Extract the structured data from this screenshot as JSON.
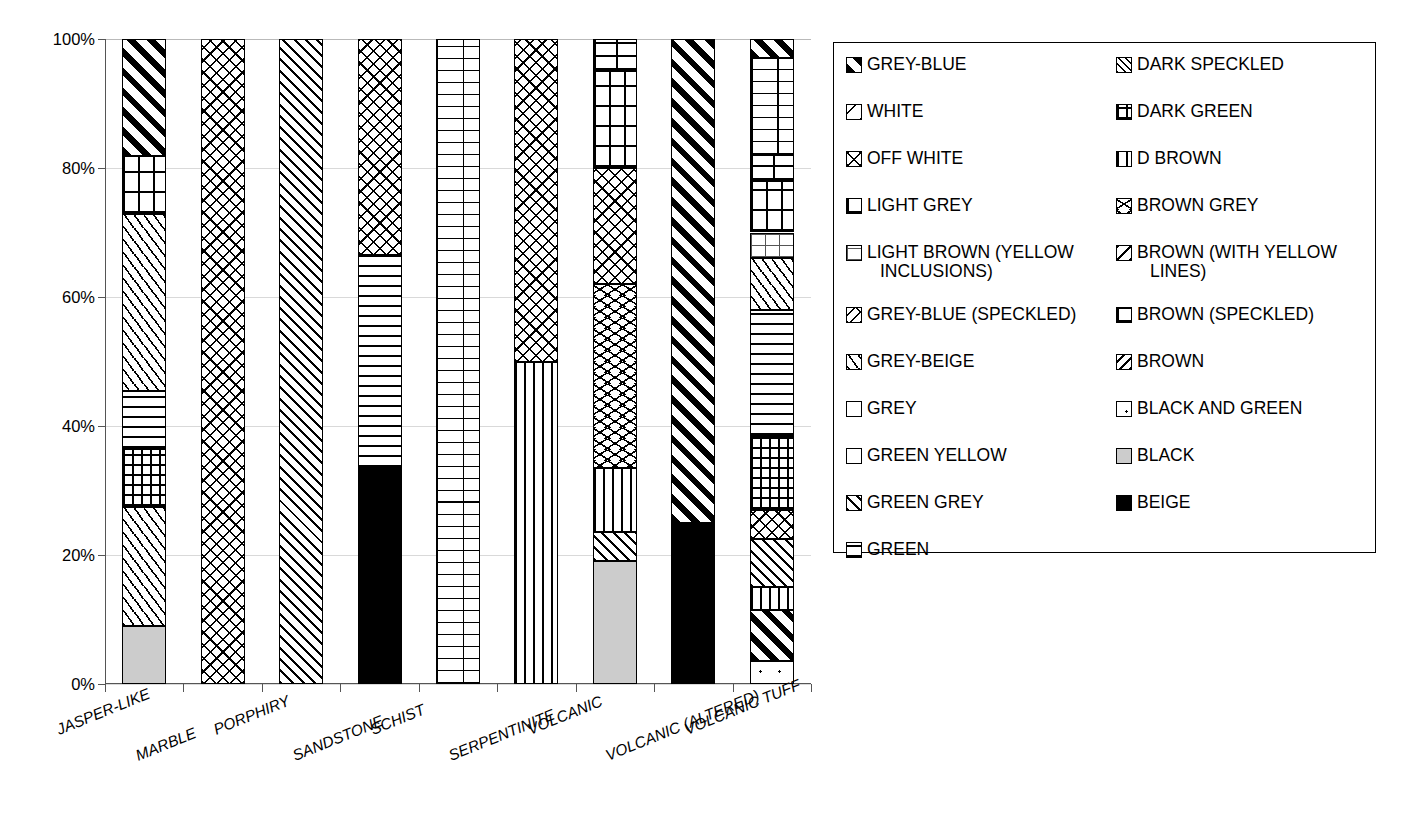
{
  "chart_data": {
    "type": "bar",
    "subtype": "stacked-100-percent",
    "title": "",
    "xlabel": "",
    "ylabel": "",
    "ylim": [
      0,
      100
    ],
    "ytick_labels": [
      "0%",
      "20%",
      "40%",
      "60%",
      "80%",
      "100%"
    ],
    "ytick_values": [
      0,
      20,
      40,
      60,
      80,
      100
    ],
    "grid": true,
    "legend_position": "right",
    "categories": [
      "JASPER-LIKE",
      "MARBLE",
      "PORPHIRY",
      "SANDSTONE",
      "SCHIST",
      "SERPENTINITE",
      "VOLCANIC",
      "VOLCANIC (ALTERED)",
      "VOLCANIC TUFF"
    ],
    "series": [
      {
        "name": "GREY-BLUE",
        "pattern": "p-greyblue",
        "values": [
          18.2,
          0,
          0,
          0,
          0,
          0,
          0,
          75.0,
          3.0
        ]
      },
      {
        "name": "WHITE",
        "pattern": "p-white",
        "values": [
          0,
          0,
          0,
          0,
          0,
          0,
          0,
          0,
          0
        ]
      },
      {
        "name": "OFF WHITE",
        "pattern": "p-offwhite",
        "values": [
          0,
          100,
          0,
          33.5,
          0,
          50.0,
          18.0,
          0,
          4.5
        ]
      },
      {
        "name": "LIGHT GREY",
        "pattern": "p-lightgrey",
        "values": [
          0,
          0,
          0,
          0,
          0,
          0,
          15.0,
          0,
          8.0
        ]
      },
      {
        "name": "LIGHT BROWN (YELLOW INCLUSIONS)",
        "pattern": "p-lightbrown",
        "values": [
          0,
          0,
          0,
          0,
          0,
          0,
          0,
          0,
          4.0
        ]
      },
      {
        "name": "GREY-BLUE (SPECKLED)",
        "pattern": "p-greyblue-sp",
        "values": [
          0,
          0,
          0,
          0,
          0,
          0,
          0,
          0,
          0
        ]
      },
      {
        "name": "GREY-BEIGE",
        "pattern": "p-greybeige",
        "values": [
          27.5,
          0,
          0,
          0,
          0,
          0,
          0,
          0,
          8.0
        ]
      },
      {
        "name": "GREY",
        "pattern": "p-grey",
        "values": [
          0,
          0,
          0,
          0,
          0,
          0,
          0,
          0,
          0
        ]
      },
      {
        "name": "GREEN YELLOW",
        "pattern": "p-greenyellow",
        "values": [
          0,
          0,
          0,
          0,
          0,
          0,
          0,
          0,
          0
        ]
      },
      {
        "name": "GREEN GREY",
        "pattern": "p-greengrey",
        "values": [
          0,
          0,
          100,
          0,
          0,
          0,
          4.5,
          0,
          7.5
        ]
      },
      {
        "name": "GREEN",
        "pattern": "p-green",
        "values": [
          9.0,
          0,
          0,
          33.0,
          0,
          0,
          0,
          0,
          19.5
        ]
      },
      {
        "name": "DARK SPECKLED",
        "pattern": "p-darkspeckled",
        "values": [
          0,
          0,
          0,
          0,
          0,
          0,
          0,
          0,
          0
        ]
      },
      {
        "name": "DARK GREEN",
        "pattern": "p-darkgreen",
        "values": [
          9.0,
          0,
          0,
          0,
          0,
          0,
          0,
          0,
          11.5
        ]
      },
      {
        "name": "D BROWN",
        "pattern": "p-dbrown",
        "values": [
          0,
          0,
          0,
          0,
          0,
          50.0,
          10.0,
          0,
          3.5
        ]
      },
      {
        "name": "BROWN GREY",
        "pattern": "p-browngrey",
        "values": [
          0,
          0,
          0,
          0,
          0,
          0,
          28.5,
          0,
          0
        ]
      },
      {
        "name": "BROWN (WITH YELLOW LINES)",
        "pattern": "p-brownyellow",
        "values": [
          0,
          0,
          0,
          0,
          0,
          0,
          0,
          0,
          0
        ]
      },
      {
        "name": "BROWN (SPECKLED)",
        "pattern": "p-brownspeckled",
        "values": [
          0,
          0,
          0,
          0,
          100,
          0,
          5.0,
          0,
          19.0
        ]
      },
      {
        "name": "BROWN",
        "pattern": "p-brown",
        "values": [
          0,
          0,
          0,
          0,
          0,
          0,
          0,
          0,
          0
        ]
      },
      {
        "name": "BLACK AND GREEN",
        "pattern": "p-blackgreen",
        "values": [
          0,
          0,
          0,
          0,
          0,
          0,
          0,
          0,
          3.5
        ]
      },
      {
        "name": "BLACK",
        "pattern": "p-black",
        "values": [
          9.0,
          0,
          0,
          0,
          0,
          0,
          19.0,
          0,
          0
        ]
      },
      {
        "name": "BEIGE",
        "pattern": "p-beige",
        "values": [
          0,
          0,
          0,
          33.5,
          0,
          0,
          0,
          25.0,
          0
        ]
      }
    ],
    "stacks": [
      {
        "category": "JASPER-LIKE",
        "segments": [
          {
            "name": "BLACK",
            "pattern": "p-black",
            "start": 0,
            "end": 9.0
          },
          {
            "name": "GREY-BEIGE",
            "pattern": "p-greybeige",
            "start": 9.0,
            "end": 27.5
          },
          {
            "name": "DARK GREEN",
            "pattern": "p-darkgreen",
            "start": 27.5,
            "end": 36.5
          },
          {
            "name": "GREEN",
            "pattern": "p-green",
            "start": 36.5,
            "end": 45.5
          },
          {
            "name": "GREY-BEIGE 2",
            "pattern": "p-greybeige",
            "start": 45.5,
            "end": 72.8
          },
          {
            "name": "LIGHT GREY",
            "pattern": "p-lightgrey",
            "start": 72.8,
            "end": 81.8
          },
          {
            "name": "GREY-BLUE",
            "pattern": "p-greyblue",
            "start": 81.8,
            "end": 100
          }
        ]
      },
      {
        "category": "MARBLE",
        "segments": [
          {
            "name": "OFF WHITE",
            "pattern": "p-offwhite",
            "start": 0,
            "end": 100
          }
        ]
      },
      {
        "category": "PORPHIRY",
        "segments": [
          {
            "name": "GREEN GREY",
            "pattern": "p-greengrey",
            "start": 0,
            "end": 100
          }
        ]
      },
      {
        "category": "SANDSTONE",
        "segments": [
          {
            "name": "BEIGE",
            "pattern": "p-beige",
            "start": 0,
            "end": 33.5
          },
          {
            "name": "GREEN",
            "pattern": "p-green",
            "start": 33.5,
            "end": 66.5
          },
          {
            "name": "OFF WHITE",
            "pattern": "p-offwhite",
            "start": 66.5,
            "end": 100
          }
        ]
      },
      {
        "category": "SCHIST",
        "segments": [
          {
            "name": "BROWN (SPECKLED)",
            "pattern": "p-brick",
            "start": 0,
            "end": 100
          }
        ]
      },
      {
        "category": "SERPENTINITE",
        "segments": [
          {
            "name": "D BROWN",
            "pattern": "p-dbrown",
            "start": 0,
            "end": 50.0
          },
          {
            "name": "OFF WHITE",
            "pattern": "p-offwhite",
            "start": 50.0,
            "end": 100
          }
        ]
      },
      {
        "category": "VOLCANIC",
        "segments": [
          {
            "name": "BLACK",
            "pattern": "p-black",
            "start": 0,
            "end": 19.0
          },
          {
            "name": "GREEN GREY",
            "pattern": "p-greengrey",
            "start": 19.0,
            "end": 23.5
          },
          {
            "name": "D BROWN",
            "pattern": "p-dbrown",
            "start": 23.5,
            "end": 33.5
          },
          {
            "name": "BROWN GREY",
            "pattern": "p-browngrey",
            "start": 33.5,
            "end": 62.0
          },
          {
            "name": "OFF WHITE",
            "pattern": "p-offwhite",
            "start": 62.0,
            "end": 80.0
          },
          {
            "name": "LIGHT GREY",
            "pattern": "p-lightgrey",
            "start": 80.0,
            "end": 95.0
          },
          {
            "name": "BROWN (SPECKLED)",
            "pattern": "p-brownspeckled",
            "start": 95.0,
            "end": 100
          }
        ]
      },
      {
        "category": "VOLCANIC (ALTERED)",
        "segments": [
          {
            "name": "BEIGE",
            "pattern": "p-beige",
            "start": 0,
            "end": 25.0
          },
          {
            "name": "GREY-BLUE",
            "pattern": "p-greyblue",
            "start": 25.0,
            "end": 100
          }
        ]
      },
      {
        "category": "VOLCANIC TUFF",
        "segments": [
          {
            "name": "BLACK AND GREEN",
            "pattern": "p-blackgreen",
            "start": 0,
            "end": 3.5
          },
          {
            "name": "GREY-BLUE",
            "pattern": "p-greyblue",
            "start": 3.5,
            "end": 11.5
          },
          {
            "name": "D BROWN",
            "pattern": "p-dbrown",
            "start": 11.5,
            "end": 15.0
          },
          {
            "name": "GREEN GREY",
            "pattern": "p-greengrey",
            "start": 15.0,
            "end": 22.5
          },
          {
            "name": "OFF WHITE",
            "pattern": "p-offwhite",
            "start": 22.5,
            "end": 27.0
          },
          {
            "name": "DARK GREEN",
            "pattern": "p-darkgreen",
            "start": 27.0,
            "end": 38.5
          },
          {
            "name": "GREEN",
            "pattern": "p-green",
            "start": 38.5,
            "end": 58.0
          },
          {
            "name": "GREY-BEIGE",
            "pattern": "p-greybeige",
            "start": 58.0,
            "end": 66.0
          },
          {
            "name": "LIGHT BROWN (YELLOW INCLUSIONS)",
            "pattern": "p-lightbrown",
            "start": 66.0,
            "end": 70.0
          },
          {
            "name": "LIGHT GREY",
            "pattern": "p-lightgrey",
            "start": 70.0,
            "end": 78.0
          },
          {
            "name": "BROWN (SPECKLED)",
            "pattern": "p-brownspeckled",
            "start": 78.0,
            "end": 82.0
          },
          {
            "name": "BROWN (SPECKLED) 2",
            "pattern": "p-brick",
            "start": 82.0,
            "end": 97.0
          },
          {
            "name": "GREY-BLUE",
            "pattern": "p-greyblue",
            "start": 97.0,
            "end": 100
          }
        ]
      }
    ]
  },
  "legend": {
    "columns": [
      {
        "items": [
          {
            "label": "GREY-BLUE",
            "swatch": "p-greyblue",
            "multiline": false
          },
          {
            "label": "WHITE",
            "swatch": "p-white",
            "multiline": false
          },
          {
            "label": "OFF WHITE",
            "swatch": "p-offwhite",
            "multiline": false
          },
          {
            "label": "LIGHT GREY",
            "swatch": "p-lightgrey",
            "multiline": false
          },
          {
            "label": "LIGHT BROWN (YELLOW",
            "label2": "INCLUSIONS)",
            "swatch": "p-lightbrown",
            "multiline": true
          },
          {
            "label": "GREY-BLUE (SPECKLED)",
            "swatch": "p-greyblue-sp",
            "multiline": false
          },
          {
            "label": "GREY-BEIGE",
            "swatch": "p-greybeige",
            "multiline": false
          },
          {
            "label": "GREY",
            "swatch": "p-grey",
            "multiline": false
          },
          {
            "label": "GREEN YELLOW",
            "swatch": "p-greenyellow",
            "multiline": false
          },
          {
            "label": "GREEN GREY",
            "swatch": "p-greengrey",
            "multiline": false
          },
          {
            "label": "GREEN",
            "swatch": "p-green",
            "multiline": false
          }
        ]
      },
      {
        "items": [
          {
            "label": "DARK SPECKLED",
            "swatch": "p-darkspeckled",
            "multiline": false
          },
          {
            "label": "DARK GREEN",
            "swatch": "p-darkgreen",
            "multiline": false
          },
          {
            "label": "D BROWN",
            "swatch": "p-dbrown",
            "multiline": false
          },
          {
            "label": "BROWN GREY",
            "swatch": "p-browngrey",
            "multiline": false
          },
          {
            "label": "BROWN (WITH YELLOW",
            "label2": "LINES)",
            "swatch": "p-brownyellow",
            "multiline": true
          },
          {
            "label": "BROWN (SPECKLED)",
            "swatch": "p-brownspeckled",
            "multiline": false
          },
          {
            "label": "BROWN",
            "swatch": "p-brown",
            "multiline": false
          },
          {
            "label": "BLACK AND GREEN",
            "swatch": "p-blackgreen",
            "multiline": false
          },
          {
            "label": "BLACK",
            "swatch": "p-black",
            "multiline": false
          },
          {
            "label": "BEIGE",
            "swatch": "p-beige",
            "multiline": false
          }
        ]
      }
    ]
  },
  "colors": {
    "axis": "#555555",
    "grid": "#d9d9d9",
    "ink": "#000000",
    "background": "#ffffff",
    "black_swatch_fill": "#cccccc"
  }
}
